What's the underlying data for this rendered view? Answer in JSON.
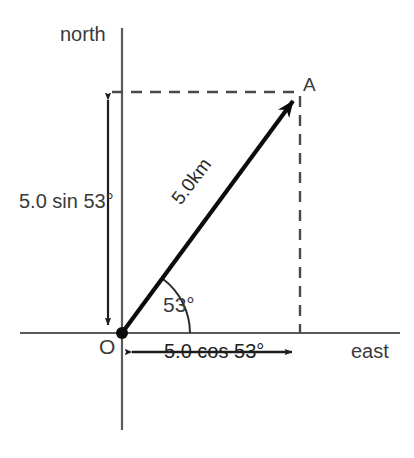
{
  "diagram": {
    "type": "vector-decomposition",
    "axes": {
      "vertical_label": "north",
      "horizontal_label": "east",
      "origin_label": "O",
      "vertical_axis": {
        "x": 122,
        "y_top": 28,
        "y_bottom": 430
      },
      "horizontal_axis": {
        "y": 333,
        "x_left": 20,
        "x_right": 400
      }
    },
    "points": {
      "origin": {
        "label": "O",
        "x": 122,
        "y": 333
      },
      "terminal": {
        "label": "A",
        "x": 300,
        "y": 92
      }
    },
    "vector": {
      "label": "5.0km",
      "magnitude": "5.0",
      "unit": "km",
      "angle_label": "53°",
      "angle_degrees": 53,
      "from": "O",
      "to": "A"
    },
    "components": {
      "north_label": "5.0 sin 53°",
      "east_label": "5.0 cos 53°",
      "north_arrow": {
        "x": 108,
        "y_top": 92,
        "y_bottom": 333
      },
      "east_arrow": {
        "y": 352,
        "x_left": 124,
        "x_right": 300
      }
    },
    "guides": {
      "horizontal_dashed": {
        "y": 92,
        "x_from": 122,
        "x_to": 300
      },
      "vertical_dashed": {
        "x": 300,
        "y_from": 92,
        "y_to": 333
      }
    },
    "colors": {
      "axis": "#555555",
      "vector": "#0f0f0f",
      "dashed": "#4a4a4a",
      "text": "#2b2b2b",
      "background": "#ffffff"
    }
  }
}
